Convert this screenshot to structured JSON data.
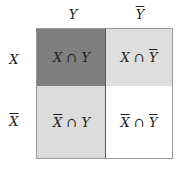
{
  "diagram": {
    "column_headers": [
      {
        "label": "Y",
        "overline": false
      },
      {
        "label": "Y",
        "overline": true
      }
    ],
    "row_headers": [
      {
        "label": "X",
        "overline": false
      },
      {
        "label": "X",
        "overline": true
      }
    ],
    "cells": [
      {
        "a": "X",
        "op": " ∩ ",
        "b": "Y",
        "a_over": false,
        "b_over": false,
        "fill": "#7f7f7f"
      },
      {
        "a": "X",
        "op": " ∩ ",
        "b": "Y",
        "a_over": false,
        "b_over": true,
        "fill": "#dedede"
      },
      {
        "a": "X",
        "op": " ∩ ",
        "b": "Y",
        "a_over": true,
        "b_over": false,
        "fill": "#dcdcdc"
      },
      {
        "a": "X",
        "op": " ∩ ",
        "b": "Y",
        "a_over": true,
        "b_over": true,
        "fill": "#ffffff"
      }
    ]
  }
}
